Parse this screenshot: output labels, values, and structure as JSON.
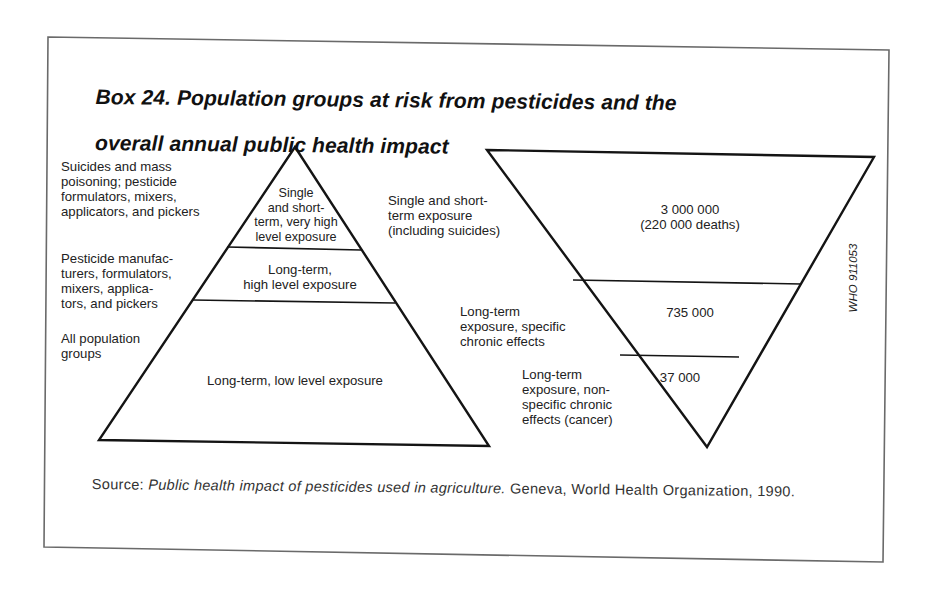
{
  "title": "Box 24. Population groups at risk from pesticides and the overall annual public health impact",
  "title_lines": [
    "Box 24. Population groups at risk from pesticides and the",
    "overall annual public health impact"
  ],
  "left_pyramid": {
    "side_labels": [
      "Suicides and mass\npoisoning; pesticide\nformulators, mixers,\napplicators, and pickers",
      "Pesticide manufac-\nturers, formulators,\nmixers, applica-\ntors, and pickers",
      "All population\ngroups"
    ],
    "tiers": [
      "Single\nand short-\nterm, very high\nlevel exposure",
      "Long-term,\nhigh level exposure",
      "Long-term, low level exposure"
    ]
  },
  "right_pyramid": {
    "side_labels": [
      "Single and short-\nterm exposure\n(including suicides)",
      "Long-term\nexposure, specific\nchronic effects",
      "Long-term\nexposure, non-\nspecific chronic\neffects (cancer)"
    ],
    "tiers": [
      "3 000 000\n(220 000 deaths)",
      "735 000",
      "37 000"
    ]
  },
  "source": {
    "prefix": "Source: ",
    "title": "Public health impact of pesticides used in agriculture.",
    "suffix": " Geneva, World Health Organization, 1990."
  },
  "figure_code": "WHO 911053",
  "colors": {
    "line": "#141414",
    "frame": "#6a6a6a",
    "text": "#222222"
  }
}
